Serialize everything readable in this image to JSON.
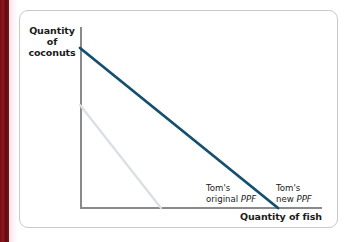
{
  "figure": {
    "background_color": "#ffffff",
    "card_border_color": "#c9c9c9",
    "page_edge_color": "#6e0f15"
  },
  "chart_data": {
    "type": "line",
    "title": "",
    "xlabel": "Quantity of fish",
    "ylabel_line1": "Quantity",
    "ylabel_line2": "of coconuts",
    "grid": false,
    "axis_color": "#8a8a8a",
    "legend_position": "inline-annotation",
    "xlim": [
      0,
      1
    ],
    "ylim": [
      0,
      1
    ],
    "series": [
      {
        "name": "Tom's original PPF",
        "label_line1": "Tom's",
        "label_line2_prefix": "original ",
        "label_line2_italic": "PPF",
        "color": "#d9dfe4",
        "width": 2.2,
        "x": [
          0,
          1
        ],
        "y": [
          0.53,
          0
        ],
        "points_px": [
          [
            60,
            94
          ],
          [
            141,
            197
          ]
        ]
      },
      {
        "name": "Tom's new PPF",
        "label_line1": "Tom's",
        "label_line2_prefix": "new ",
        "label_line2_italic": "PPF",
        "color": "#14506e",
        "width": 2.8,
        "x": [
          0,
          1
        ],
        "y": [
          1.0,
          0
        ],
        "points_px": [
          [
            60,
            37
          ],
          [
            258,
            197
          ]
        ]
      }
    ]
  }
}
